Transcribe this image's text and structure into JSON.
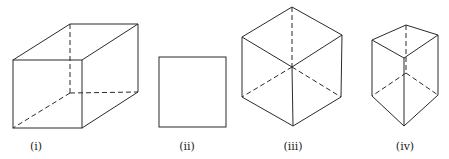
{
  "figures": [
    {
      "id": "i",
      "label": "(i)",
      "shape": "cuboid",
      "label_pos": [
        36,
        148
      ]
    },
    {
      "id": "ii",
      "label": "(ii)",
      "shape": "square",
      "label_pos": [
        187,
        148
      ]
    },
    {
      "id": "iii",
      "label": "(iii)",
      "shape": "cube-hexagonal-view",
      "label_pos": [
        293,
        148
      ]
    },
    {
      "id": "iv",
      "label": "(iv)",
      "shape": "triangular-prism",
      "label_pos": [
        405,
        148
      ]
    }
  ],
  "colors": {
    "line": "#2a2a2a",
    "background": "#ffffff"
  }
}
